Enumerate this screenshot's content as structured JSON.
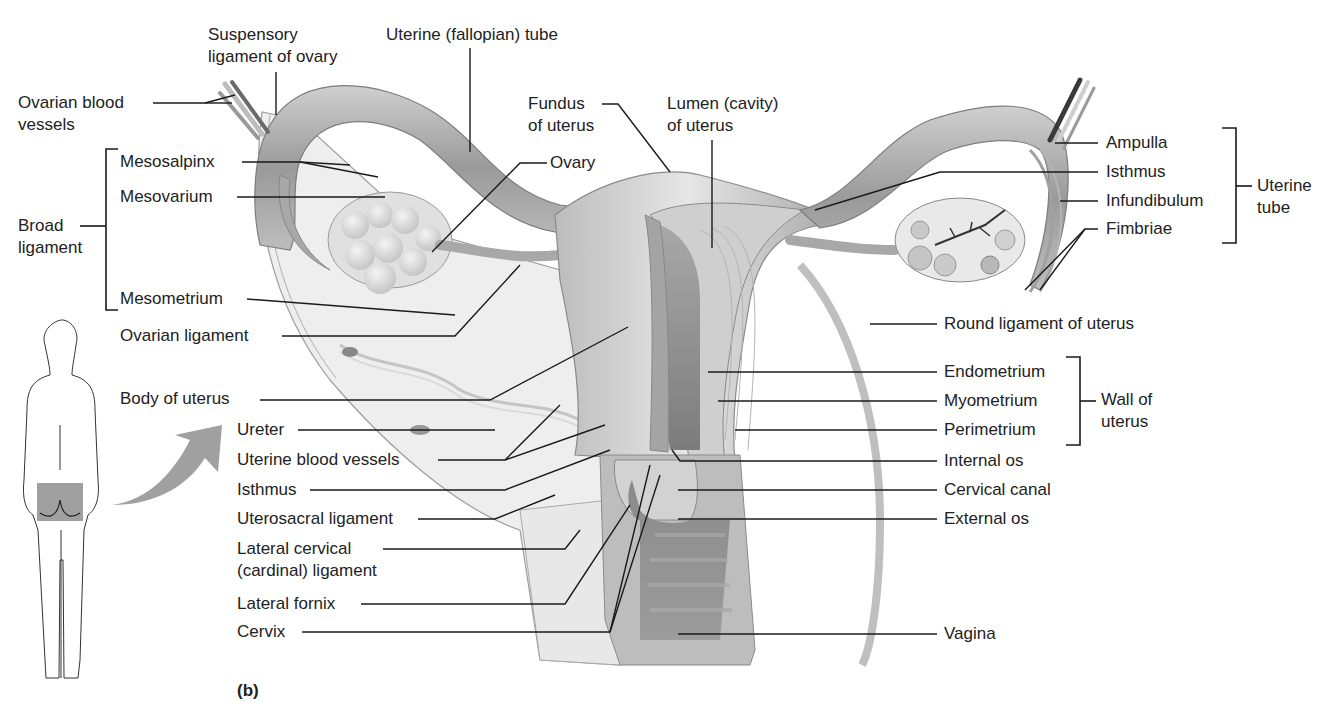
{
  "figure": {
    "panel_label": "(b)",
    "colors": {
      "background": "#ffffff",
      "label_text": "#222222",
      "leader_line": "#1a1a1a",
      "tissue_light": "#d9d9d9",
      "tissue_mid": "#b5b5b5",
      "tissue_dark": "#7a7a7a",
      "highlight_box": "#8f8f8f",
      "arrow": "#a0a0a0"
    }
  },
  "labels": {
    "left": {
      "ovarian_blood_vessels": [
        "Ovarian blood",
        "vessels"
      ],
      "broad_ligament": [
        "Broad",
        "ligament"
      ],
      "mesosalpinx": "Mesosalpinx",
      "mesovarium": "Mesovarium",
      "mesometrium": "Mesometrium",
      "ovarian_ligament": "Ovarian ligament",
      "body_of_uterus": "Body of uterus",
      "ureter": "Ureter",
      "uterine_blood_vessels": "Uterine blood vessels",
      "isthmus": "Isthmus",
      "uterosacral_ligament": "Uterosacral ligament",
      "lateral_cervical_ligament": [
        "Lateral cervical",
        "(cardinal) ligament"
      ],
      "lateral_fornix": "Lateral fornix",
      "cervix": "Cervix"
    },
    "top": {
      "suspensory_ligament": [
        "Suspensory",
        "ligament of ovary"
      ],
      "uterine_tube": "Uterine (fallopian) tube",
      "fundus": [
        "Fundus",
        "of uterus"
      ],
      "lumen": [
        "Lumen (cavity)",
        "of uterus"
      ],
      "ovary": "Ovary"
    },
    "right": {
      "ampulla": "Ampulla",
      "isthmus": "Isthmus",
      "infundibulum": "Infundibulum",
      "fimbriae": "Fimbriae",
      "uterine_tube_group": [
        "Uterine",
        "tube"
      ],
      "round_ligament": "Round ligament of uterus",
      "endometrium": "Endometrium",
      "myometrium": "Myometrium",
      "perimetrium": "Perimetrium",
      "wall_of_uterus_group": [
        "Wall of",
        "uterus"
      ],
      "internal_os": "Internal os",
      "cervical_canal": "Cervical canal",
      "external_os": "External os",
      "vagina": "Vagina"
    }
  },
  "icons": {
    "body_outline": "human-figure-posterior-icon",
    "direction_arrow": "curved-arrow-icon"
  }
}
